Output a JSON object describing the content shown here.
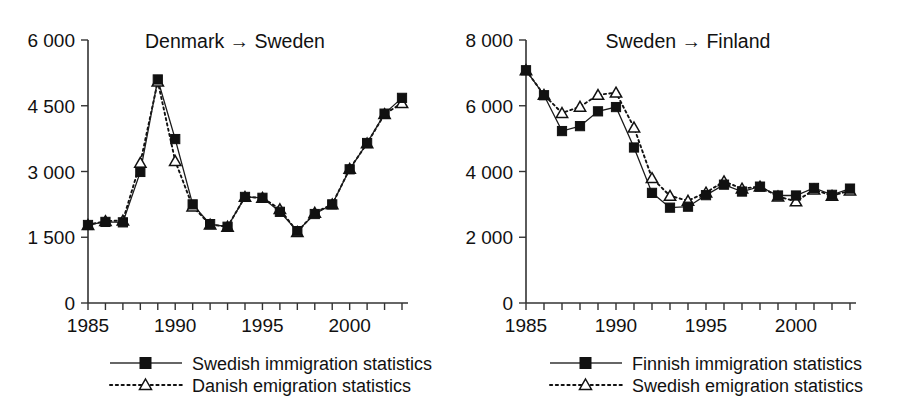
{
  "figure": {
    "width": 900,
    "height": 419,
    "background": "#ffffff",
    "ink_color": "#111111"
  },
  "chart_data": [
    {
      "type": "line",
      "title": "Denmark → Sweden",
      "xlabel": "",
      "ylabel": "",
      "xlim": [
        1985,
        2003
      ],
      "ylim": [
        0,
        6000
      ],
      "ytick_labels": [
        "0",
        "1 500",
        "3 000",
        "4 500",
        "6 000"
      ],
      "ytick_values": [
        0,
        1500,
        3000,
        4500,
        6000
      ],
      "xtick_labels": [
        "1985",
        "1990",
        "1995",
        "2000"
      ],
      "xtick_values": [
        1985,
        1990,
        1995,
        2000
      ],
      "xticks_minor_every": 1,
      "grid": false,
      "legend_position": "bottom",
      "x": [
        1985,
        1986,
        1987,
        1988,
        1989,
        1990,
        1991,
        1992,
        1993,
        1994,
        1995,
        1996,
        1997,
        1998,
        1999,
        2000,
        2001,
        2002,
        2003
      ],
      "series": [
        {
          "name": "Swedish immigration statistics",
          "marker": "filled-square",
          "line": "solid",
          "values": [
            1780,
            1850,
            1840,
            2990,
            5100,
            3740,
            2250,
            1800,
            1740,
            2420,
            2400,
            2080,
            1640,
            2030,
            2250,
            3050,
            3650,
            4320,
            4680
          ]
        },
        {
          "name": "Danish emigration statistics",
          "marker": "open-triangle",
          "line": "dotted",
          "values": [
            1780,
            1870,
            1880,
            3200,
            5050,
            3240,
            2200,
            1790,
            1740,
            2420,
            2400,
            2140,
            1620,
            2060,
            2250,
            3060,
            3640,
            4310,
            4560
          ]
        }
      ]
    },
    {
      "type": "line",
      "title": "Sweden → Finland",
      "xlabel": "",
      "ylabel": "",
      "xlim": [
        1985,
        2003
      ],
      "ylim": [
        0,
        8000
      ],
      "ytick_labels": [
        "0",
        "2 000",
        "4 000",
        "6 000",
        "8 000"
      ],
      "ytick_values": [
        0,
        2000,
        4000,
        6000,
        8000
      ],
      "xtick_labels": [
        "1985",
        "1990",
        "1995",
        "2000"
      ],
      "xtick_values": [
        1985,
        1990,
        1995,
        2000
      ],
      "xticks_minor_every": 1,
      "grid": false,
      "legend_position": "bottom",
      "x": [
        1985,
        1986,
        1987,
        1988,
        1989,
        1990,
        1991,
        1992,
        1993,
        1994,
        1995,
        1996,
        1997,
        1998,
        1999,
        2000,
        2001,
        2002,
        2003
      ],
      "series": [
        {
          "name": "Finnish immigration statistics",
          "marker": "filled-square",
          "line": "solid",
          "values": [
            7080,
            6320,
            5230,
            5380,
            5830,
            5960,
            4730,
            3350,
            2900,
            2930,
            3280,
            3600,
            3390,
            3540,
            3270,
            3270,
            3500,
            3290,
            3480
          ]
        },
        {
          "name": "Swedish emigration statistics",
          "marker": "open-triangle",
          "line": "dotted",
          "values": [
            7080,
            6330,
            5780,
            5970,
            6330,
            6400,
            5340,
            3800,
            3260,
            3110,
            3360,
            3700,
            3480,
            3540,
            3240,
            3090,
            3450,
            3260,
            3420
          ]
        }
      ]
    }
  ]
}
